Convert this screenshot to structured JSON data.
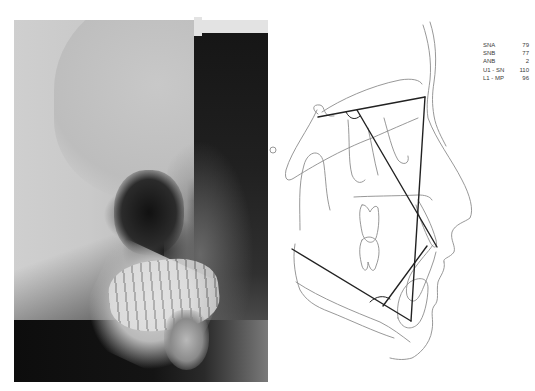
{
  "figure": {
    "left_panel": {
      "type": "lateral cephalometric radiograph"
    },
    "right_panel": {
      "type": "cephalometric tracing",
      "line_color": "#222222",
      "trace_color": "#8a8a8a"
    },
    "measurements": [
      {
        "label": "SNA",
        "value": "79"
      },
      {
        "label": "SNB",
        "value": "77"
      },
      {
        "label": "ANB",
        "value": "2"
      },
      {
        "label": "U1 - SN",
        "value": "110"
      },
      {
        "label": "L1 - MP",
        "value": "96"
      }
    ]
  }
}
